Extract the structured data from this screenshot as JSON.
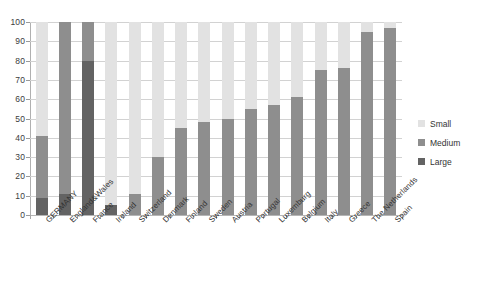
{
  "chart_data": {
    "type": "bar",
    "title": "",
    "subtitle": "",
    "xlabel": "",
    "ylabel": "",
    "ylim": [
      0,
      100
    ],
    "yticks": [
      0,
      10,
      20,
      30,
      40,
      50,
      60,
      70,
      80,
      90,
      100
    ],
    "grid": true,
    "legend_position": "right",
    "stacked": false,
    "overlapping": true,
    "categories": [
      "GERMANY",
      "England&Wales",
      "France",
      "Ireland",
      "Switzerland",
      "Denmark",
      "Finland",
      "Sweden",
      "Austria",
      "Portugal",
      "Luxemburg",
      "Belgium",
      "Italy",
      "Greece",
      "The Netherlands",
      "Spain"
    ],
    "series": [
      {
        "name": "Small",
        "color": "#e2e2e2",
        "values": [
          100,
          100,
          100,
          100,
          100,
          100,
          100,
          100,
          100,
          100,
          100,
          100,
          100,
          100,
          100,
          100
        ]
      },
      {
        "name": "Medium",
        "color": "#8e8e8e",
        "values": [
          41,
          100,
          100,
          5,
          11,
          30,
          45,
          48,
          50,
          55,
          57,
          61,
          75,
          76,
          95,
          97
        ]
      },
      {
        "name": "Large",
        "color": "#636363",
        "values": [
          9,
          11,
          80,
          5,
          0,
          0,
          0,
          0,
          0,
          0,
          0,
          0,
          0,
          0,
          0,
          0
        ]
      }
    ]
  },
  "legend": {
    "items": [
      {
        "label": "Small",
        "key": "small"
      },
      {
        "label": "Medium",
        "key": "medium"
      },
      {
        "label": "Large",
        "key": "large"
      }
    ]
  },
  "colors": {
    "small": "#e2e2e2",
    "medium": "#8e8e8e",
    "large": "#636363",
    "grid": "#d2d2d2",
    "axis": "#a8a8a8",
    "text": "#333333",
    "background": "#ffffff"
  }
}
